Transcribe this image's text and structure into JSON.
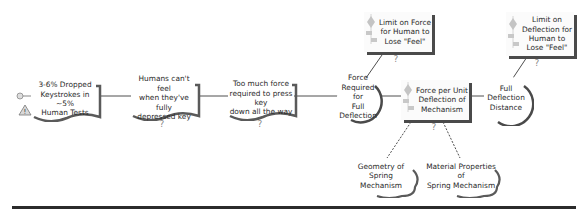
{
  "diagram": {
    "type": "causal-chain / requirements map",
    "nodes": [
      {
        "id": "n1",
        "shape": "document",
        "label": "3-6% Dropped Keystrokes in ~5% Human Tests",
        "icons": [
          "key-icon",
          "warning-icon"
        ]
      },
      {
        "id": "n2",
        "shape": "document",
        "label": "Humans can't feel when they've fully depressed key",
        "icons": [
          "question-icon"
        ]
      },
      {
        "id": "n3",
        "shape": "document",
        "label": "Too much force required to press key down all the way",
        "icons": [
          "question-icon"
        ]
      },
      {
        "id": "n4",
        "shape": "circle",
        "label": "Force Required for Full Deflection",
        "icons": []
      },
      {
        "id": "n5",
        "shape": "rectangle",
        "label": "Limit on Force for Human to Lose \"Feel\"",
        "icons": [
          "diamond-gauge-icon",
          "question-icon"
        ]
      },
      {
        "id": "n6",
        "shape": "rectangle",
        "label": "Force per Unit Deflection of Mechanism",
        "icons": [
          "diamond-gauge-icon",
          "question-icon"
        ]
      },
      {
        "id": "n7",
        "shape": "circle",
        "label": "Full Deflection Distance",
        "icons": []
      },
      {
        "id": "n8",
        "shape": "rectangle",
        "label": "Limit on Deflection for Human to Lose \"Feel\"",
        "icons": [
          "diamond-gauge-icon",
          "question-icon"
        ]
      },
      {
        "id": "n9",
        "shape": "cloud",
        "label": "Geometry of Spring Mechanism",
        "icons": []
      },
      {
        "id": "n10",
        "shape": "cloud",
        "label": "Material Properties of Spring Mechanism",
        "icons": []
      }
    ],
    "edges": [
      {
        "from": "n1",
        "to": "n2",
        "style": "solid"
      },
      {
        "from": "n2",
        "to": "n3",
        "style": "solid"
      },
      {
        "from": "n3",
        "to": "n4",
        "style": "solid"
      },
      {
        "from": "n4",
        "to": "n5",
        "style": "solid"
      },
      {
        "from": "n4",
        "to": "n6",
        "style": "solid"
      },
      {
        "from": "n6",
        "to": "n7",
        "style": "solid"
      },
      {
        "from": "n7",
        "to": "n8",
        "style": "solid"
      },
      {
        "from": "n6",
        "to": "n9",
        "style": "dashed"
      },
      {
        "from": "n6",
        "to": "n10",
        "style": "dashed"
      }
    ]
  },
  "labels": {
    "n1": [
      "3-6% Dropped",
      "Keystrokes in ~5%",
      "Human Tests"
    ],
    "n2": [
      "Humans can't feel",
      "when they've fully",
      "depressed key"
    ],
    "n3": [
      "Too much force",
      "required to press key",
      "down all the way"
    ],
    "n4": [
      "Force",
      "Required for",
      "Full",
      "Deflection"
    ],
    "n5": [
      "Limit on Force",
      "for Human to",
      "Lose \"Feel\""
    ],
    "n6": [
      "Force per Unit",
      "Deflection of",
      "Mechanism"
    ],
    "n7": [
      "Full Deflection",
      "Distance"
    ],
    "n8": [
      "Limit on",
      "Deflection for",
      "Human to",
      "Lose \"Feel\""
    ],
    "n9": [
      "Geometry of Spring",
      "Mechanism"
    ],
    "n10": [
      "Material Properties of",
      "Spring Mechanism"
    ]
  },
  "colors": {
    "line": "#3a3a3a",
    "shadow": "#4a4a4a",
    "icon_gray": "#b8b8b8",
    "warning_fill": "#d8d8d8",
    "rule": "#2b2b2b"
  }
}
